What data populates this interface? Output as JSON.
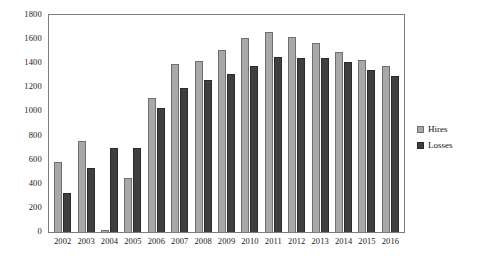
{
  "chart_data": {
    "type": "bar",
    "title": "",
    "subtitle": "",
    "xlabel": "",
    "ylabel": "",
    "ylim": [
      0,
      1800
    ],
    "ytick_step": 200,
    "yticks": [
      1800,
      1600,
      1400,
      1200,
      1000,
      800,
      600,
      400,
      200,
      0
    ],
    "grid": false,
    "legend_position": "right",
    "categories": [
      "2002",
      "2003",
      "2004",
      "2005",
      "2006",
      "2007",
      "2008",
      "2009",
      "2010",
      "2011",
      "2012",
      "2013",
      "2014",
      "2015",
      "2016"
    ],
    "series": [
      {
        "name": "Hires",
        "color": "#a8a8a8",
        "values": [
          580,
          755,
          20,
          450,
          1110,
          1390,
          1420,
          1510,
          1610,
          1655,
          1615,
          1565,
          1490,
          1430,
          1375
        ]
      },
      {
        "name": "Losses",
        "color": "#3f3f3f",
        "values": [
          320,
          530,
          695,
          700,
          1030,
          1195,
          1265,
          1310,
          1380,
          1450,
          1440,
          1445,
          1410,
          1340,
          1290
        ]
      }
    ]
  },
  "legend": {
    "items": [
      {
        "label": "Hires",
        "swatch_icon": "legend-swatch-icon"
      },
      {
        "label": "Losses",
        "swatch_icon": "legend-swatch-icon"
      }
    ]
  },
  "axes": {
    "y_tick_labels": [
      "1800",
      "1600",
      "1400",
      "1200",
      "1000",
      "800",
      "600",
      "400",
      "200",
      "0"
    ],
    "x_tick_labels": [
      "2002",
      "2003",
      "2004",
      "2005",
      "2006",
      "2007",
      "2008",
      "2009",
      "2010",
      "2011",
      "2012",
      "2013",
      "2014",
      "2015",
      "2016"
    ]
  }
}
